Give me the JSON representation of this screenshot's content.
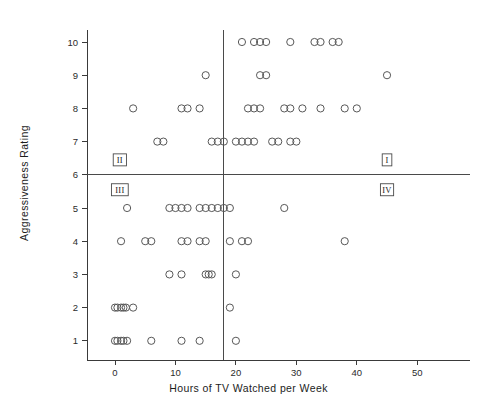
{
  "chart_data": {
    "type": "scatter",
    "title": "",
    "xlabel": "Hours of TV Watched per Week",
    "ylabel": "Aggressiveness Rating",
    "xlim": [
      -3,
      57
    ],
    "ylim": [
      0.3,
      10.8
    ],
    "grid": false,
    "legend": null,
    "xticks": [
      0,
      10,
      20,
      30,
      40,
      50
    ],
    "xtick_labels": [
      "0",
      "10",
      "20",
      "30",
      "40",
      "50"
    ],
    "yticks": [
      1,
      2,
      3,
      4,
      5,
      6,
      7,
      8,
      9,
      10
    ],
    "ytick_labels": [
      "1",
      "2",
      "3",
      "4",
      "5",
      "6",
      "7",
      "8",
      "9",
      "10"
    ],
    "reference_lines": {
      "vertical_x": 17.9,
      "horizontal_y": 6.0
    },
    "marker": "open-circle",
    "marker_color": "#585858",
    "points": [
      [
        21,
        10
      ],
      [
        23,
        10
      ],
      [
        24,
        10
      ],
      [
        25,
        10
      ],
      [
        29,
        10
      ],
      [
        33,
        10
      ],
      [
        34,
        10
      ],
      [
        36,
        10
      ],
      [
        37,
        10
      ],
      [
        15,
        9
      ],
      [
        24,
        9
      ],
      [
        25,
        9
      ],
      [
        45,
        9
      ],
      [
        3,
        8
      ],
      [
        11,
        8
      ],
      [
        12,
        8
      ],
      [
        14,
        8
      ],
      [
        22,
        8
      ],
      [
        23,
        8
      ],
      [
        24,
        8
      ],
      [
        28,
        8
      ],
      [
        29,
        8
      ],
      [
        31,
        8
      ],
      [
        34,
        8
      ],
      [
        38,
        8
      ],
      [
        40,
        8
      ],
      [
        7,
        7
      ],
      [
        8,
        7
      ],
      [
        16,
        7
      ],
      [
        17,
        7
      ],
      [
        18,
        7
      ],
      [
        20,
        7
      ],
      [
        21,
        7
      ],
      [
        22,
        7
      ],
      [
        23,
        7
      ],
      [
        26,
        7
      ],
      [
        27,
        7
      ],
      [
        29,
        7
      ],
      [
        30,
        7
      ],
      [
        2,
        5
      ],
      [
        9,
        5
      ],
      [
        10,
        5
      ],
      [
        11,
        5
      ],
      [
        12,
        5
      ],
      [
        14,
        5
      ],
      [
        15,
        5
      ],
      [
        16,
        5
      ],
      [
        17,
        5
      ],
      [
        18,
        5
      ],
      [
        19,
        5
      ],
      [
        28,
        5
      ],
      [
        1,
        4
      ],
      [
        5,
        4
      ],
      [
        6,
        4
      ],
      [
        11,
        4
      ],
      [
        12,
        4
      ],
      [
        14,
        4
      ],
      [
        15,
        4
      ],
      [
        19,
        4
      ],
      [
        21,
        4
      ],
      [
        22,
        4
      ],
      [
        38,
        4
      ],
      [
        9,
        3
      ],
      [
        11,
        3
      ],
      [
        15,
        3
      ],
      [
        15.5,
        3
      ],
      [
        16,
        3
      ],
      [
        20,
        3
      ],
      [
        0,
        2
      ],
      [
        0.4,
        2
      ],
      [
        1,
        2
      ],
      [
        1.4,
        2
      ],
      [
        1.8,
        2
      ],
      [
        3,
        2
      ],
      [
        19,
        2
      ],
      [
        0,
        1
      ],
      [
        0.4,
        1
      ],
      [
        1,
        1
      ],
      [
        1.4,
        1
      ],
      [
        2,
        1
      ],
      [
        6,
        1
      ],
      [
        11,
        1
      ],
      [
        14,
        1
      ],
      [
        20,
        1
      ]
    ],
    "annotations": [
      {
        "label": "I",
        "x": 45.0,
        "y": 6.45
      },
      {
        "label": "II",
        "x": 0.8,
        "y": 6.45
      },
      {
        "label": "III",
        "x": 0.8,
        "y": 5.55
      },
      {
        "label": "IV",
        "x": 45.0,
        "y": 5.55
      }
    ]
  }
}
